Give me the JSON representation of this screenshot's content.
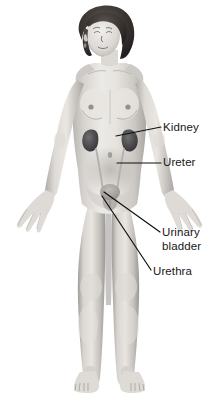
{
  "figure": {
    "name": "female-urinary-system-diagram",
    "background_color": "#ffffff",
    "text_color": "#17171a",
    "leader_line_color": "#111111"
  },
  "labels": [
    {
      "id": "kidney",
      "text": "Kidney",
      "lines": [
        "Kidney"
      ],
      "x": 163,
      "y": 121,
      "leader": {
        "type": "angled",
        "from_x": 116,
        "from_y": 136,
        "to_x": 161,
        "to_y": 127
      }
    },
    {
      "id": "ureter",
      "text": "Ureter",
      "lines": [
        "Ureter"
      ],
      "x": 163,
      "y": 156,
      "leader": {
        "type": "horizontal",
        "from_x": 117,
        "from_y": 163,
        "to_x": 161,
        "to_y": 163
      }
    },
    {
      "id": "urinary-bladder",
      "text": "Urinary bladder",
      "lines": [
        "Urinary",
        "bladder"
      ],
      "x": 162,
      "y": 226,
      "leader": {
        "type": "angled",
        "from_x": 104,
        "from_y": 192,
        "to_x": 160,
        "to_y": 232
      }
    },
    {
      "id": "urethra",
      "text": "Urethra",
      "lines": [
        "Urethra"
      ],
      "x": 153,
      "y": 265,
      "leader": {
        "type": "angled",
        "from_x": 102,
        "from_y": 196,
        "to_x": 151,
        "to_y": 270
      }
    }
  ],
  "organs": [
    {
      "id": "kidney-left",
      "name": "left kidney",
      "shade": "#4a4a4c"
    },
    {
      "id": "kidney-right",
      "name": "right kidney",
      "shade": "#4a4a4c"
    },
    {
      "id": "ureter-left",
      "name": "left ureter",
      "shade": "#b8b8b8"
    },
    {
      "id": "ureter-right",
      "name": "right ureter",
      "shade": "#b8b8b8"
    },
    {
      "id": "bladder",
      "name": "urinary bladder",
      "shade": "#9a9a9a"
    },
    {
      "id": "urethra",
      "name": "urethra",
      "shade": "#9a9a9a"
    }
  ]
}
